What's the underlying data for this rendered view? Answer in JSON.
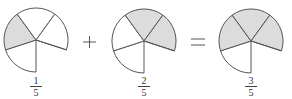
{
  "colors": {
    "shaded": "#dcdcdc",
    "unshaded": "#ffffff",
    "stroke": "#555555"
  },
  "circles": [
    {
      "id": "circle-1",
      "cx": 36,
      "cy": 40,
      "r": 32,
      "sectors": 5,
      "shaded_sectors": [
        1
      ],
      "fraction": {
        "numerator": "1",
        "denominator": "5"
      }
    },
    {
      "id": "circle-2",
      "cx": 144,
      "cy": 41,
      "r": 32,
      "sectors": 5,
      "shaded_sectors": [
        2,
        3
      ],
      "fraction": {
        "numerator": "2",
        "denominator": "5"
      }
    },
    {
      "id": "circle-3",
      "cx": 251,
      "cy": 41,
      "r": 32,
      "sectors": 5,
      "shaded_sectors": [
        1,
        2,
        3
      ],
      "fraction": {
        "numerator": "3",
        "denominator": "5"
      }
    }
  ],
  "operators": {
    "plus": "+",
    "equals": "="
  },
  "equation": "1/5 + 2/5 = 3/5"
}
